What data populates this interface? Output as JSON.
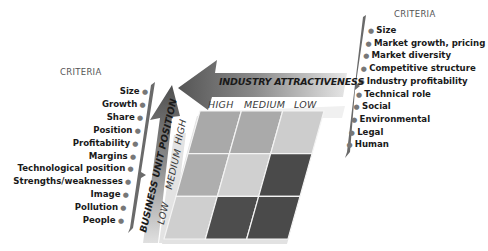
{
  "diagram": {
    "type": "GE-McKinsey matrix",
    "left_panel": {
      "title": "CRITERIA",
      "items": [
        "Size",
        "Growth",
        "Share",
        "Position",
        "Profitability",
        "Margins",
        "Technological position",
        "Strengths/weaknesses",
        "Image",
        "Pollution",
        "People"
      ]
    },
    "right_panel": {
      "title": "CRITERIA",
      "items": [
        "Size",
        "Market growth, pricing",
        "Market diversity",
        "Competitive structure",
        "Industry profitability",
        "Technical role",
        "Social",
        "Environmental",
        "Legal",
        "Human"
      ]
    },
    "horizontal_axis": {
      "label": "INDUSTRY ATTRACTIVENESS",
      "levels": [
        "HIGH",
        "MEDIUM",
        "LOW"
      ]
    },
    "vertical_axis": {
      "label": "BUSINESS UNIT POSITION",
      "levels": [
        "LOW",
        "MEDIUM",
        "HIGH"
      ]
    },
    "grid": {
      "rows_top_to_bottom": [
        [
          "#a9a9a9",
          "#aaaaaa",
          "#cdcdcd"
        ],
        [
          "#aeaeae",
          "#d0d0d0",
          "#4a4a4a"
        ],
        [
          "#cfcfcf",
          "#4d4d4d",
          "#4a4a4a"
        ]
      ]
    },
    "colors": {
      "arrow_dark": "#5b5b5b",
      "arrow_light": "#d8d8d8",
      "bracket": "#6a6a6a"
    }
  }
}
